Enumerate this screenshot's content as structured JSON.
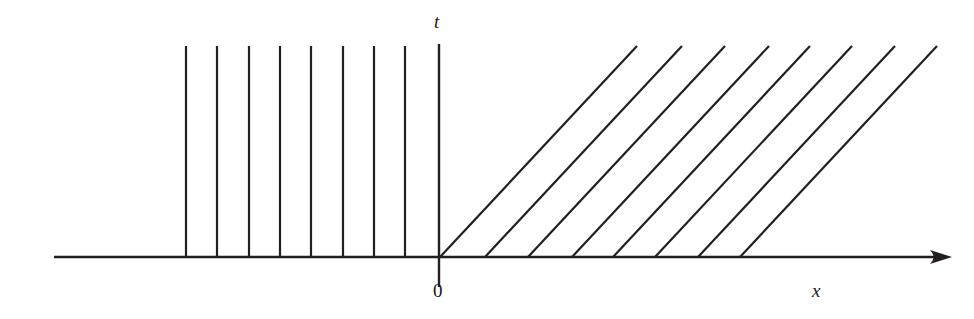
{
  "figure": {
    "kind": "characteristics-diagram",
    "width": 974,
    "height": 319,
    "background_color": "#ffffff",
    "line_color": "#231f20",
    "axis_color": "#231f20"
  },
  "labels": {
    "t_axis_label": "t",
    "x_axis_label": "x",
    "origin_label": "0"
  },
  "chart_data": {
    "type": "line",
    "title": "",
    "subtitle": "",
    "xlabel": "x",
    "ylabel": "t",
    "grid": false,
    "legend": null,
    "annotations": [
      "0"
    ],
    "axes": {
      "x_axis": {
        "label": "x",
        "y_pixel": 257,
        "x_start_pixel": 54,
        "x_end_pixel": 952,
        "arrow_at_end": true,
        "arrow_at_start": false,
        "stroke_width": 2.6
      },
      "t_axis": {
        "label": "t",
        "x_pixel": 439,
        "y_top_pixel": 44,
        "y_bottom_pixel": 287,
        "arrow_at_end": false,
        "stroke_width": 2.4
      },
      "origin": {
        "x_pixel": 439,
        "y_pixel": 257,
        "label": "0"
      }
    },
    "label_positions": {
      "t": {
        "x_pixel": 434,
        "y_pixel": 12
      },
      "x": {
        "x_pixel": 812,
        "y_pixel": 281
      },
      "0": {
        "x_pixel": 433,
        "y_pixel": 281
      }
    },
    "series": [
      {
        "name": "left-characteristics-vertical",
        "description": "Vertical characteristic lines for x < 0, slope infinite (dx/dt = 0)",
        "count": 8,
        "slope_dx_dt": 0,
        "stroke_width": 2.2,
        "y_top_pixel": 46,
        "y_bottom_pixel": 257,
        "x_values_pixel": [
          186,
          217,
          249,
          280,
          311,
          343,
          374,
          405
        ]
      },
      {
        "name": "right-characteristics-diagonal",
        "description": "Parallel diagonal characteristic lines for x > 0, constant positive slope",
        "count": 8,
        "slope_dx_dt": 0.935,
        "stroke_width": 2.2,
        "y_base_pixel": 257,
        "y_top_pixel": 46,
        "x_base_pixel": [
          440,
          485,
          528,
          572,
          613,
          655,
          698,
          740
        ],
        "x_top_pixel": [
          637,
          682,
          725,
          769,
          810,
          852,
          895,
          937
        ]
      }
    ]
  }
}
